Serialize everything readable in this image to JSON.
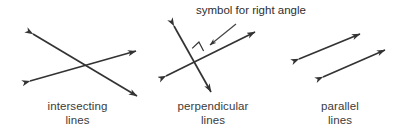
{
  "figure": {
    "background_color": "#ffffff",
    "stroke_color": "#333333",
    "text_color": "#3b3b3b",
    "panels": [
      {
        "id": "intersecting",
        "caption_line1": "intersecting",
        "caption_line2": "lines",
        "description": "two double-headed arrows crossing in an X",
        "lines": [
          {
            "name": "line-a",
            "x1": 30,
            "y1": 32,
            "x2": 140,
            "y2": 98,
            "arrows": "both"
          },
          {
            "name": "line-b",
            "x1": 27,
            "y1": 82,
            "x2": 139,
            "y2": 50,
            "arrows": "both"
          }
        ]
      },
      {
        "id": "perpendicular",
        "caption_line1": "perpendicular",
        "caption_line2": "lines",
        "description": "two double-headed arrows crossing at 90 degrees with a right angle square",
        "lines": [
          {
            "name": "line-steep",
            "x1": 172,
            "y1": 22,
            "x2": 213,
            "y2": 95,
            "arrows": "both"
          },
          {
            "name": "line-shallow",
            "x1": 163,
            "y1": 78,
            "x2": 258,
            "y2": 30,
            "arrows": "both"
          }
        ],
        "right_angle_marker": {
          "name": "right-angle-square",
          "size": 9
        },
        "annotation": {
          "text": "symbol for right angle",
          "leader": {
            "x1": 237,
            "y1": 25,
            "x2": 209,
            "y2": 46
          }
        }
      },
      {
        "id": "parallel",
        "caption_line1": "parallel",
        "caption_line2": "lines",
        "description": "two non-intersecting double-headed arrows with equal slope",
        "lines": [
          {
            "name": "line-upper",
            "x1": 296,
            "y1": 60,
            "x2": 363,
            "y2": 32,
            "arrows": "both"
          },
          {
            "name": "line-lower",
            "x1": 320,
            "y1": 78,
            "x2": 388,
            "y2": 48,
            "arrows": "both"
          }
        ]
      }
    ]
  }
}
